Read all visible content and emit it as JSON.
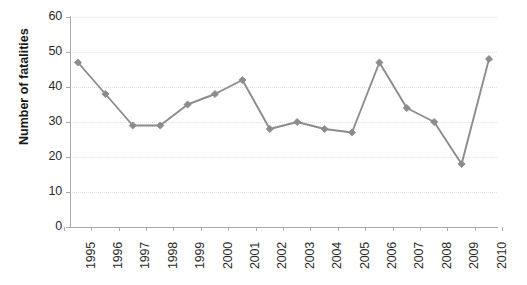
{
  "chart_data": {
    "type": "line",
    "title": "",
    "xlabel": "",
    "ylabel": "Number of fatalities",
    "categories": [
      "1995",
      "1996",
      "1997",
      "1998",
      "1999",
      "2000",
      "2001",
      "2002",
      "2003",
      "2004",
      "2005",
      "2006",
      "2007",
      "2008",
      "2009",
      "2010"
    ],
    "values": [
      47,
      38,
      29,
      29,
      35,
      38,
      42,
      28,
      30,
      28,
      27,
      47,
      34,
      30,
      18,
      48
    ],
    "series": [
      {
        "name": "Number of fatalities",
        "values": [
          47,
          38,
          29,
          29,
          35,
          38,
          42,
          28,
          30,
          28,
          27,
          47,
          34,
          30,
          18,
          48
        ]
      }
    ],
    "ylim": [
      0,
      60
    ],
    "yticks": [
      0,
      10,
      20,
      30,
      40,
      50,
      60
    ],
    "ytick_labels": [
      "0",
      "10",
      "20",
      "30",
      "40",
      "50",
      "60"
    ],
    "grid": true,
    "grid_axis": "y",
    "legend": "none",
    "marker": "diamond",
    "colors": {
      "line": "#8c8c8c",
      "marker": "#8c8c8c",
      "grid": "#e3e3e3",
      "axis": "#aaaaaa",
      "text": "#2b2b2b",
      "background": "#ffffff"
    }
  }
}
